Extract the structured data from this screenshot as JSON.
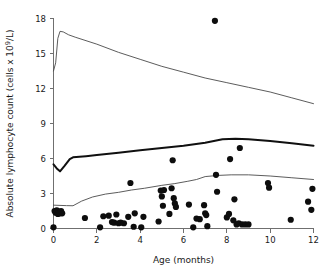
{
  "chart_data": {
    "type": "scatter",
    "title": "",
    "xlabel": "Age (months)",
    "ylabel": "Absolute lymphocyte count (cells x 10⁹/L)",
    "ylabel_parts": {
      "pre": "Absolute lymphocyte count (cells x 10",
      "sup": "9",
      "post": "/L)"
    },
    "xlim": [
      0,
      12
    ],
    "ylim": [
      0,
      18
    ],
    "xticks": [
      0,
      2,
      4,
      6,
      8,
      10,
      12
    ],
    "yticks": [
      0,
      3,
      6,
      9,
      12,
      15,
      18
    ],
    "xticklabels": [
      "0",
      "2",
      "4",
      "6",
      "8",
      "10",
      "12"
    ],
    "yticklabels": [
      "0",
      "3",
      "6",
      "9",
      "12",
      "15",
      "18"
    ],
    "grid": false,
    "legend": false,
    "legend_position": "none",
    "colors": {
      "point": "#0d0d0d",
      "median_line": "#101010",
      "reference_line": "#4a4a4a",
      "axis": "#6f6f6f",
      "background": "#ffffff"
    },
    "series": [
      {
        "name": "Upper reference limit (97.5th centile)",
        "type": "line",
        "style": "thin",
        "x": [
          0.0,
          0.1,
          0.2,
          0.3,
          0.45,
          0.7,
          1.0,
          1.5,
          2.0,
          3.0,
          4.0,
          5.0,
          6.0,
          7.0,
          8.0,
          9.0,
          10.0,
          11.0,
          12.0
        ],
        "values": [
          13.5,
          14.2,
          16.3,
          16.9,
          16.85,
          16.6,
          16.4,
          16.1,
          15.8,
          15.1,
          14.5,
          13.9,
          13.4,
          12.9,
          12.5,
          12.1,
          11.7,
          11.2,
          10.7
        ]
      },
      {
        "name": "Median (50th centile)",
        "type": "line",
        "style": "thick",
        "x": [
          0.0,
          0.15,
          0.3,
          0.5,
          0.75,
          0.9,
          1.5,
          2.0,
          3.0,
          4.0,
          5.0,
          6.0,
          7.0,
          7.8,
          8.4,
          9.0,
          10.0,
          11.0,
          12.0
        ],
        "values": [
          5.5,
          5.15,
          4.9,
          5.35,
          5.95,
          6.1,
          6.2,
          6.3,
          6.5,
          6.7,
          6.9,
          7.1,
          7.35,
          7.65,
          7.7,
          7.65,
          7.5,
          7.3,
          7.1
        ]
      },
      {
        "name": "Lower reference limit (2.5th centile)",
        "type": "line",
        "style": "thin",
        "x": [
          0.0,
          0.3,
          0.6,
          0.9,
          1.3,
          1.8,
          2.4,
          3.0,
          3.6,
          4.2,
          5.0,
          5.6,
          6.2,
          6.6,
          7.0,
          7.6,
          8.2,
          9.0,
          10.0,
          11.0,
          12.0
        ],
        "values": [
          2.0,
          1.98,
          1.96,
          1.95,
          2.35,
          2.7,
          2.95,
          3.1,
          3.3,
          3.45,
          3.7,
          3.85,
          4.05,
          4.2,
          4.45,
          4.55,
          4.6,
          4.6,
          4.5,
          4.35,
          4.2
        ]
      },
      {
        "name": "Patient observations",
        "type": "scatter",
        "points": [
          [
            0.0,
            0.1
          ],
          [
            0.05,
            1.5
          ],
          [
            0.1,
            1.35
          ],
          [
            0.15,
            1.55
          ],
          [
            0.2,
            1.25
          ],
          [
            0.25,
            1.45
          ],
          [
            0.3,
            1.3
          ],
          [
            0.35,
            1.5
          ],
          [
            0.4,
            1.3
          ],
          [
            1.45,
            0.9
          ],
          [
            2.15,
            0.1
          ],
          [
            2.3,
            1.05
          ],
          [
            2.55,
            1.1
          ],
          [
            2.7,
            0.55
          ],
          [
            2.8,
            0.5
          ],
          [
            2.9,
            1.2
          ],
          [
            3.0,
            0.45
          ],
          [
            3.1,
            0.5
          ],
          [
            3.25,
            0.45
          ],
          [
            3.45,
            1.0
          ],
          [
            3.55,
            3.9
          ],
          [
            3.7,
            0.15
          ],
          [
            3.75,
            1.3
          ],
          [
            4.05,
            0.1
          ],
          [
            4.15,
            1.0
          ],
          [
            4.85,
            0.6
          ],
          [
            4.95,
            3.25
          ],
          [
            5.0,
            2.75
          ],
          [
            5.05,
            1.95
          ],
          [
            5.1,
            3.3
          ],
          [
            5.35,
            1.25
          ],
          [
            5.45,
            3.45
          ],
          [
            5.5,
            5.85
          ],
          [
            5.55,
            2.6
          ],
          [
            5.6,
            2.15
          ],
          [
            5.65,
            1.85
          ],
          [
            6.25,
            2.05
          ],
          [
            6.45,
            0.1
          ],
          [
            6.6,
            0.85
          ],
          [
            6.75,
            0.8
          ],
          [
            6.95,
            2.0
          ],
          [
            7.0,
            1.3
          ],
          [
            7.05,
            1.15
          ],
          [
            7.1,
            0.2
          ],
          [
            7.45,
            17.8
          ],
          [
            7.5,
            4.6
          ],
          [
            7.55,
            3.15
          ],
          [
            8.0,
            0.95
          ],
          [
            8.1,
            1.25
          ],
          [
            8.15,
            5.95
          ],
          [
            8.3,
            0.7
          ],
          [
            8.45,
            0.35
          ],
          [
            8.55,
            0.45
          ],
          [
            8.6,
            6.9
          ],
          [
            8.7,
            0.35
          ],
          [
            8.85,
            0.35
          ],
          [
            9.0,
            0.35
          ],
          [
            8.35,
            2.5
          ],
          [
            9.9,
            3.9
          ],
          [
            9.95,
            3.5
          ],
          [
            10.95,
            0.75
          ],
          [
            11.75,
            2.3
          ],
          [
            11.95,
            3.4
          ],
          [
            11.9,
            1.6
          ]
        ]
      }
    ]
  },
  "axes": {
    "x_axis_name": "Age (months)",
    "y_axis_name": "Absolute lymphocyte count (cells x 10⁹/L)"
  }
}
